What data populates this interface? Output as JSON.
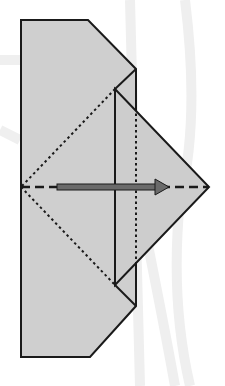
{
  "diagram": {
    "type": "origami-fold-step",
    "colors": {
      "paper": "#cfcfcf",
      "outline": "#1a1a1a",
      "arrow": "#6a6a6a",
      "watermark": "#eeeeee",
      "background": "#ffffff"
    },
    "shapes": {
      "outer_paper": "21,20 88,20 136,69 136,306 90,357 21,357",
      "folded_flap": "115,89 209,187 115,285",
      "corner_top": "136,69 115,89",
      "corner_bottom": "115,285 136,306"
    },
    "lines": {
      "mountain_fold_vertical": {
        "x": 136,
        "y1": 108,
        "y2": 266,
        "style": "dotted"
      },
      "valley_fold_horizontal": {
        "y": 187,
        "x1": 21,
        "x2": 209,
        "style": "dashed"
      },
      "crease_upper_diagonal": {
        "x1": 115,
        "y1": 89,
        "x2": 21,
        "y2": 187,
        "style": "dotted"
      },
      "crease_lower_diagonal": {
        "x1": 21,
        "y1": 187,
        "x2": 115,
        "y2": 285,
        "style": "dotted"
      },
      "flap_edge_vertical": {
        "x": 115,
        "y1": 89,
        "y2": 285,
        "style": "solid"
      }
    },
    "arrow": {
      "x1": 57,
      "x2": 169,
      "y": 187,
      "direction": "right"
    },
    "bottom_caption_fragment": ". . . . . . . . . . ."
  }
}
